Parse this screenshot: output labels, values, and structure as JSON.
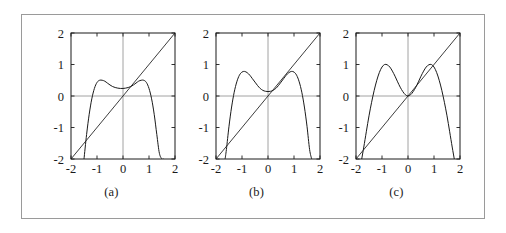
{
  "figure": {
    "border_color": "#9a9a9a",
    "background": "#ffffff",
    "curve_color": "#1a1a1a",
    "axis_color": "#8a8a8a"
  },
  "panels": [
    {
      "id": "a",
      "caption": "(a)",
      "chart_data": {
        "type": "line",
        "title": "",
        "xlabel": "",
        "ylabel": "",
        "xlim": [
          -2,
          2
        ],
        "ylim": [
          -2,
          2
        ],
        "xticks": [
          -2,
          -1,
          0,
          1,
          2
        ],
        "yticks": [
          -2,
          -1,
          0,
          1,
          2
        ],
        "xticklabels": [
          "-2",
          "-1",
          "0",
          "1",
          "2"
        ],
        "yticklabels": [
          "-2",
          "-1",
          "0",
          "1",
          "2"
        ],
        "grid": false,
        "legend": "none",
        "series": [
          {
            "name": "identity-line",
            "style": "straight",
            "x": [
              -2,
              2
            ],
            "values": [
              -2,
              2
            ]
          },
          {
            "name": "map-curve",
            "style": "curve",
            "x": [
              -1.5,
              -1.4,
              -1.3,
              -1.2,
              -1.1,
              -1.0,
              -0.9,
              -0.8,
              -0.7,
              -0.6,
              -0.5,
              -0.4,
              -0.3,
              -0.2,
              -0.1,
              0.0,
              0.1,
              0.2,
              0.3,
              0.4,
              0.5,
              0.6,
              0.7,
              0.8,
              0.9,
              1.0,
              1.1,
              1.2,
              1.3,
              1.4,
              1.5,
              1.55
            ],
            "values": [
              -2.0,
              -1.22,
              -0.58,
              -0.09,
              0.24,
              0.43,
              0.5,
              0.5,
              0.47,
              0.41,
              0.35,
              0.3,
              0.27,
              0.25,
              0.24,
              0.24,
              0.25,
              0.27,
              0.3,
              0.35,
              0.41,
              0.47,
              0.5,
              0.5,
              0.43,
              0.24,
              -0.09,
              -0.58,
              -1.22,
              -1.82,
              -2.0,
              -2.0
            ]
          }
        ],
        "intersections_with_identity": 3
      }
    },
    {
      "id": "b",
      "caption": "(b)",
      "chart_data": {
        "type": "line",
        "title": "",
        "xlabel": "",
        "ylabel": "",
        "xlim": [
          -2,
          2
        ],
        "ylim": [
          -2,
          2
        ],
        "xticks": [
          -2,
          -1,
          0,
          1,
          2
        ],
        "yticks": [
          -2,
          -1,
          0,
          1,
          2
        ],
        "xticklabels": [
          "-2",
          "-1",
          "0",
          "1",
          "2"
        ],
        "yticklabels": [
          "-2",
          "-1",
          "0",
          "1",
          "2"
        ],
        "grid": false,
        "legend": "none",
        "series": [
          {
            "name": "identity-line",
            "style": "straight",
            "x": [
              -2,
              2
            ],
            "values": [
              -2,
              2
            ]
          },
          {
            "name": "map-curve",
            "style": "curve",
            "x": [
              -1.65,
              -1.6,
              -1.5,
              -1.4,
              -1.3,
              -1.2,
              -1.1,
              -1.0,
              -0.9,
              -0.8,
              -0.7,
              -0.6,
              -0.5,
              -0.4,
              -0.3,
              -0.2,
              -0.1,
              0.0,
              0.1,
              0.2,
              0.3,
              0.4,
              0.5,
              0.6,
              0.7,
              0.8,
              0.9,
              1.0,
              1.1,
              1.2,
              1.3,
              1.4,
              1.5,
              1.6,
              1.68
            ],
            "values": [
              -2.0,
              -1.7,
              -0.96,
              -0.35,
              0.12,
              0.45,
              0.66,
              0.76,
              0.78,
              0.74,
              0.66,
              0.55,
              0.44,
              0.33,
              0.24,
              0.18,
              0.15,
              0.14,
              0.15,
              0.18,
              0.24,
              0.33,
              0.44,
              0.55,
              0.66,
              0.74,
              0.78,
              0.76,
              0.66,
              0.45,
              0.12,
              -0.35,
              -0.96,
              -1.7,
              -2.0
            ]
          }
        ],
        "intersections_with_identity": 3
      }
    },
    {
      "id": "c",
      "caption": "(c)",
      "chart_data": {
        "type": "line",
        "title": "",
        "xlabel": "",
        "ylabel": "",
        "xlim": [
          -2,
          2
        ],
        "ylim": [
          -2,
          2
        ],
        "xticks": [
          -2,
          -1,
          0,
          1,
          2
        ],
        "yticks": [
          -2,
          -1,
          0,
          1,
          2
        ],
        "xticklabels": [
          "-2",
          "-1",
          "0",
          "1",
          "2"
        ],
        "yticklabels": [
          "-2",
          "-1",
          "0",
          "1",
          "2"
        ],
        "grid": false,
        "legend": "none",
        "series": [
          {
            "name": "identity-line",
            "style": "straight",
            "x": [
              -2,
              2
            ],
            "values": [
              -2,
              2
            ]
          },
          {
            "name": "map-curve",
            "style": "curve",
            "x": [
              -1.78,
              -1.7,
              -1.6,
              -1.5,
              -1.4,
              -1.3,
              -1.2,
              -1.1,
              -1.0,
              -0.9,
              -0.8,
              -0.7,
              -0.6,
              -0.5,
              -0.4,
              -0.3,
              -0.2,
              -0.1,
              0.0,
              0.1,
              0.2,
              0.3,
              0.4,
              0.5,
              0.6,
              0.7,
              0.8,
              0.9,
              1.0,
              1.1,
              1.2,
              1.3,
              1.4,
              1.5,
              1.6,
              1.7,
              1.78
            ],
            "values": [
              -2.0,
              -1.62,
              -1.12,
              -0.63,
              -0.2,
              0.18,
              0.5,
              0.75,
              0.92,
              1.0,
              0.99,
              0.92,
              0.79,
              0.63,
              0.45,
              0.28,
              0.14,
              0.04,
              0.0,
              0.04,
              0.14,
              0.28,
              0.45,
              0.63,
              0.79,
              0.92,
              0.99,
              1.0,
              0.92,
              0.75,
              0.5,
              0.18,
              -0.2,
              -0.63,
              -1.12,
              -1.62,
              -2.0
            ]
          }
        ],
        "intersections_with_identity": 3
      }
    }
  ]
}
